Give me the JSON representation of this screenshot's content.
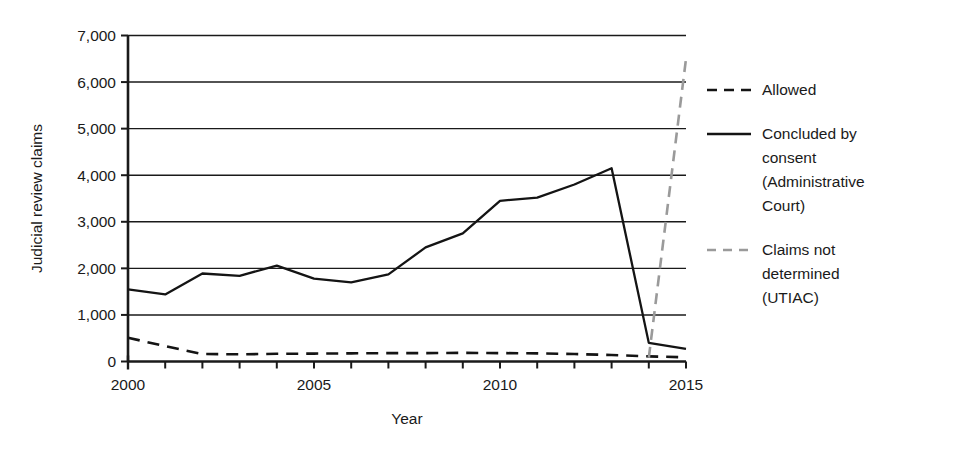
{
  "chart_data": {
    "type": "line",
    "title": "",
    "xlabel": "Year",
    "ylabel": "Judicial review claims",
    "xlim": [
      2000,
      2015
    ],
    "ylim": [
      0,
      7000
    ],
    "ytick_labels": [
      "0",
      "1,000",
      "2,000",
      "3,000",
      "4,000",
      "5,000",
      "6,000",
      "7,000"
    ],
    "ytick_values": [
      0,
      1000,
      2000,
      3000,
      4000,
      5000,
      6000,
      7000
    ],
    "xtick_values": [
      2000,
      2001,
      2002,
      2003,
      2004,
      2005,
      2006,
      2007,
      2008,
      2009,
      2010,
      2011,
      2012,
      2013,
      2014,
      2015
    ],
    "xtick_labels": [
      {
        "value": 2000,
        "label": "2000"
      },
      {
        "value": 2005,
        "label": "2005"
      },
      {
        "value": 2010,
        "label": "2010"
      },
      {
        "value": 2015,
        "label": "2015"
      }
    ],
    "grid": "horizontal",
    "legend_position": "right",
    "series": [
      {
        "name": "Allowed",
        "style": "dashed",
        "color": "#141414",
        "x": [
          2000,
          2001,
          2002,
          2003,
          2004,
          2005,
          2006,
          2007,
          2008,
          2009,
          2010,
          2011,
          2012,
          2013,
          2014,
          2015
        ],
        "values": [
          510,
          330,
          160,
          155,
          165,
          170,
          175,
          180,
          180,
          185,
          180,
          175,
          160,
          140,
          110,
          90
        ]
      },
      {
        "name": "Concluded by consent (Administrative Court)",
        "style": "solid",
        "color": "#141414",
        "x": [
          2000,
          2001,
          2002,
          2003,
          2004,
          2005,
          2006,
          2007,
          2008,
          2009,
          2010,
          2011,
          2012,
          2013,
          2014,
          2015
        ],
        "values": [
          1550,
          1440,
          1890,
          1840,
          2060,
          1780,
          1700,
          1870,
          2450,
          2750,
          3450,
          3520,
          3800,
          4150,
          400,
          270
        ]
      },
      {
        "name": "Claims not determined (UTIAC)",
        "style": "dashed",
        "color": "#9a9a9a",
        "x": [
          2014,
          2015
        ],
        "values": [
          80,
          6500
        ]
      }
    ],
    "legend_entries": [
      {
        "label": "Allowed",
        "style": "dashed",
        "color": "#141414"
      },
      {
        "label": "Concluded by consent (Administrative Court)",
        "lines": [
          "Concluded by",
          "consent",
          "(Administrative",
          "Court)"
        ],
        "style": "solid",
        "color": "#141414"
      },
      {
        "label": "Claims not determined (UTIAC)",
        "lines": [
          "Claims not",
          "determined",
          "(UTIAC)"
        ],
        "style": "dashed",
        "color": "#9a9a9a"
      }
    ]
  }
}
